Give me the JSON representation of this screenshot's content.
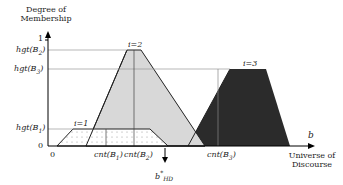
{
  "diagram": {
    "y_axis_title": [
      "Degree of",
      "Membership"
    ],
    "x_axis_title": [
      "Universe of",
      "Discourse"
    ],
    "x_axis_symbol": "b",
    "y_ticks": {
      "one": "1",
      "zero": "0"
    },
    "y_levels": [
      {
        "id": "hgt-b2",
        "label": "hgt(B2)",
        "main": "hgt(B",
        "sub": "2",
        "close": ")"
      },
      {
        "id": "hgt-b3",
        "label": "hgt(B3)",
        "main": "hgt(B",
        "sub": "3",
        "close": ")"
      },
      {
        "id": "hgt-b1",
        "label": "hgt(B1)",
        "main": "hgt(B",
        "sub": "1",
        "close": ")"
      }
    ],
    "x_origin": "0",
    "x_labels": [
      {
        "id": "cnt-b1",
        "main": "cnt(B",
        "sub": "1",
        "close": ")"
      },
      {
        "id": "cnt-b2",
        "main": "cnt(B",
        "sub": "2",
        "close": ")"
      },
      {
        "id": "cnt-b3",
        "main": "cnt(B",
        "sub": "3",
        "close": ")"
      }
    ],
    "sets": [
      {
        "label": "i=1",
        "fill": "dotted",
        "color": "#ffffff"
      },
      {
        "label": "i=2",
        "fill": "light",
        "color": "#d9d9d9"
      },
      {
        "label": "i=3",
        "fill": "dark",
        "color": "#2a2a2a"
      }
    ],
    "defuzzified": {
      "main": "b",
      "sup": "*",
      "sub": "HD"
    }
  }
}
